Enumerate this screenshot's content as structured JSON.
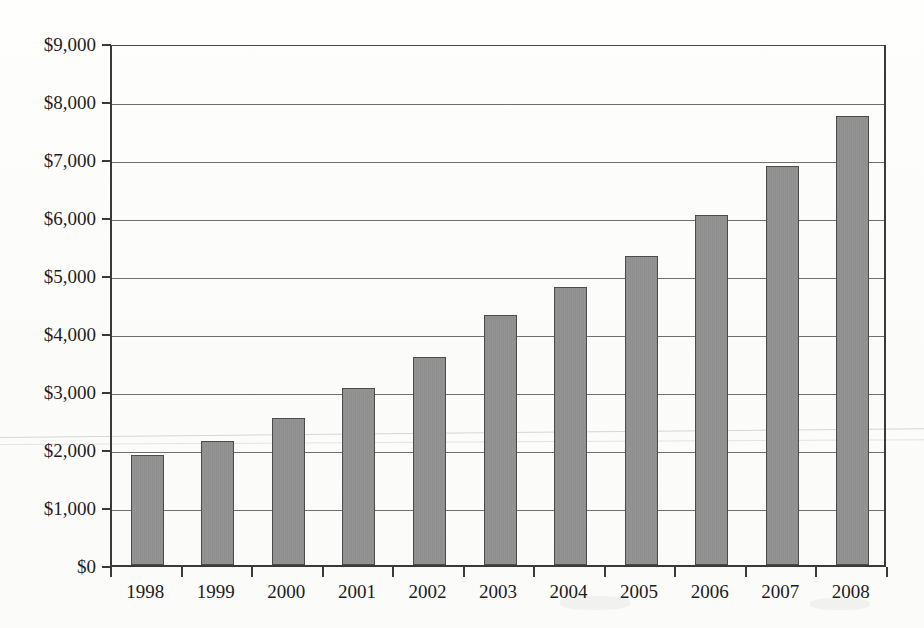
{
  "chart_data": {
    "type": "bar",
    "title": "",
    "subtitle": "",
    "xlabel": "",
    "ylabel": "",
    "categories": [
      "1998",
      "1999",
      "2000",
      "2001",
      "2002",
      "2003",
      "2004",
      "2005",
      "2006",
      "2007",
      "2008"
    ],
    "values": [
      1890,
      2130,
      2530,
      3060,
      3580,
      4310,
      4800,
      5320,
      6030,
      6880,
      7750
    ],
    "ylim": [
      0,
      9000
    ],
    "ytick_values": [
      0,
      1000,
      2000,
      3000,
      4000,
      5000,
      6000,
      7000,
      8000,
      9000
    ],
    "ytick_labels": [
      "$0",
      "$1,000",
      "$2,000",
      "$3,000",
      "$4,000",
      "$5,000",
      "$6,000",
      "$7,000",
      "$8,000",
      "$9,000"
    ],
    "grid": true,
    "grid_axis": "y",
    "legend": false,
    "legend_position": "none",
    "value_prefix": "$",
    "bar_color": "#909090",
    "bar_border_color": "#4c4c4c",
    "axis_color": "#3a3a3a",
    "gridline_color": "#6f6f6f",
    "text_color": "#1c1c1c",
    "background_color": "#fdfdfc"
  },
  "figure": {
    "plot_left": 110,
    "plot_top": 45,
    "plot_width": 776,
    "plot_height": 522
  }
}
